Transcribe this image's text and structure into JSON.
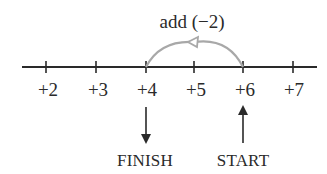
{
  "operation": {
    "label": "add (−2)"
  },
  "number_line": {
    "ticks": [
      {
        "label": "+2",
        "x": 46
      },
      {
        "label": "+3",
        "x": 96
      },
      {
        "label": "+4",
        "x": 146
      },
      {
        "label": "+5",
        "x": 194
      },
      {
        "label": "+6",
        "x": 243
      },
      {
        "label": "+7",
        "x": 293
      }
    ]
  },
  "markers": {
    "finish": {
      "label": "FINISH",
      "value": "+4"
    },
    "start": {
      "label": "START",
      "value": "+6"
    }
  },
  "colors": {
    "line": "#2a2a2a",
    "arc": "#a8a8a8"
  }
}
